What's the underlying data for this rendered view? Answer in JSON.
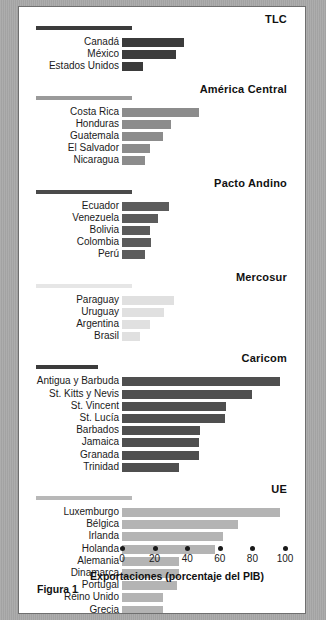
{
  "figure": {
    "caption": "Figura 1"
  },
  "chart_data": {
    "type": "bar",
    "orientation": "horizontal",
    "title": "",
    "xlabel": "Exportaciones (porcentaje del PIB)",
    "ylabel": "",
    "xlim": [
      0,
      100
    ],
    "xticks": [
      0,
      20,
      40,
      60,
      80,
      100
    ],
    "xtick_labels": [
      "0",
      "20",
      "40",
      "60",
      "80",
      "100"
    ],
    "grid": false,
    "legend": "none",
    "groups": [
      {
        "name": "TLC",
        "color": "#3b3b3b",
        "rule_color": "#3b3b3b",
        "rule_width": 96,
        "categories": [
          "Canadá",
          "México",
          "Estados Unidos"
        ],
        "values": [
          38,
          33,
          13
        ]
      },
      {
        "name": "América Central",
        "color": "#8c8c8c",
        "rule_color": "#9a9a9a",
        "rule_width": 96,
        "categories": [
          "Costa Rica",
          "Honduras",
          "Guatemala",
          "El Salvador",
          "Nicaragua"
        ],
        "values": [
          47,
          30,
          25,
          17,
          14
        ]
      },
      {
        "name": "Pacto Andino",
        "color": "#5c5c5c",
        "rule_color": "#4a4a4a",
        "rule_width": 96,
        "categories": [
          "Ecuador",
          "Venezuela",
          "Bolivia",
          "Colombia",
          "Perú"
        ],
        "values": [
          29,
          22,
          17,
          18,
          14
        ]
      },
      {
        "name": "Mercosur",
        "color": "#e0e0e0",
        "rule_color": "#e6e6e6",
        "rule_width": 96,
        "categories": [
          "Paraguay",
          "Uruguay",
          "Argentina",
          "Brasil"
        ],
        "values": [
          32,
          26,
          17,
          11
        ]
      },
      {
        "name": "Caricom",
        "color": "#4f4f4f",
        "rule_color": "#3b3b3b",
        "rule_width": 62,
        "categories": [
          "Antigua y Barbuda",
          "St. Kitts y Nevis",
          "St. Vincent",
          "St. Lucía",
          "Barbados",
          "Jamaica",
          "Granada",
          "Trinidad"
        ],
        "values": [
          97,
          80,
          64,
          63,
          48,
          47,
          47,
          35
        ]
      },
      {
        "name": "UE",
        "color": "#b4b4b4",
        "rule_color": "#b8b8b8",
        "rule_width": 96,
        "categories": [
          "Luxemburgo",
          "Bélgica",
          "Irlanda",
          "Holanda",
          "Alemania",
          "Dinamarca",
          "Portugal",
          "Reino Unido",
          "Grecia",
          "Francia",
          "Italia",
          "España"
        ],
        "values": [
          97,
          71,
          62,
          57,
          35,
          35,
          34,
          25,
          25,
          24,
          20,
          19
        ]
      }
    ]
  }
}
